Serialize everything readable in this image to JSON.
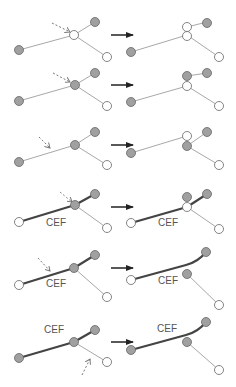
{
  "colors": {
    "node_filled": "#a0a0a0",
    "node_empty": "#ffffff",
    "node_stroke": "#666666",
    "thin_edge": "#a8a8a8",
    "thick_edge": "#444444",
    "transition_arrow": "#222222",
    "cursor_arrow": "#888888"
  },
  "label_text": "CEF",
  "rows": [
    {
      "id": 1,
      "before": {
        "label": null
      },
      "after": {
        "label": null
      }
    },
    {
      "id": 2,
      "before": {
        "label": null
      },
      "after": {
        "label": null
      }
    },
    {
      "id": 3,
      "before": {
        "label": null
      },
      "after": {
        "label": null
      }
    },
    {
      "id": 4,
      "before": {
        "label": "CEF"
      },
      "after": {
        "label": "CEF"
      }
    },
    {
      "id": 5,
      "before": {
        "label": "CEF"
      },
      "after": {
        "label": "CEF"
      }
    },
    {
      "id": 6,
      "before": {
        "label": "CEF"
      },
      "after": {
        "label": "CEF"
      }
    }
  ]
}
